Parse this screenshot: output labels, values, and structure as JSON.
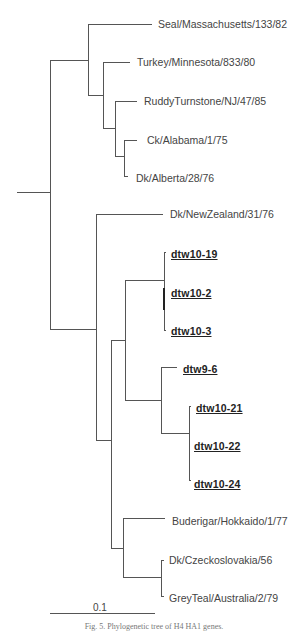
{
  "figure": {
    "caption": "Fig. 5. Phylogenetic tree of H4 HA1 genes.",
    "scale_bar": {
      "label": "0.1",
      "x1": 50,
      "x2": 155,
      "y": 613
    }
  },
  "tree": {
    "line_color": "#555555",
    "highlight_color": "#222222",
    "leaves": [
      {
        "name": "Seal/Massachusetts/133/82",
        "x": 158,
        "y": 24,
        "highlight": false
      },
      {
        "name": "Turkey/Minnesota/833/80",
        "x": 137,
        "y": 62,
        "highlight": false
      },
      {
        "name": "RuddyTurnstone/NJ/47/85",
        "x": 144,
        "y": 101,
        "highlight": false
      },
      {
        "name": "Ck/Alabama/1/75",
        "x": 147,
        "y": 140,
        "highlight": false
      },
      {
        "name": "Dk/Alberta/28/76",
        "x": 136,
        "y": 178,
        "highlight": false
      },
      {
        "name": "Dk/NewZealand/31/76",
        "x": 170,
        "y": 214,
        "highlight": false
      },
      {
        "name": "dtw10-19",
        "x": 171,
        "y": 254,
        "highlight": true
      },
      {
        "name": "dtw10-2",
        "x": 171,
        "y": 293,
        "highlight": true
      },
      {
        "name": "dtw10-3",
        "x": 171,
        "y": 331,
        "highlight": true
      },
      {
        "name": "dtw9-6",
        "x": 183,
        "y": 369,
        "highlight": true
      },
      {
        "name": "dtw10-21",
        "x": 196,
        "y": 408,
        "highlight": true
      },
      {
        "name": "dtw10-22",
        "x": 194,
        "y": 446,
        "highlight": true
      },
      {
        "name": "dtw10-24",
        "x": 194,
        "y": 484,
        "highlight": true
      },
      {
        "name": "Buderigar/Hokkaido/1/77",
        "x": 172,
        "y": 521,
        "highlight": false
      },
      {
        "name": "Dk/Czeckoslovakia/56",
        "x": 169,
        "y": 560,
        "highlight": false
      },
      {
        "name": "GreyTeal/Australia/2/79",
        "x": 169,
        "y": 598,
        "highlight": false
      }
    ],
    "segments": [
      [
        17,
        192,
        50,
        192
      ],
      [
        50,
        60,
        50,
        329
      ],
      [
        50,
        60,
        88,
        60
      ],
      [
        88,
        24,
        88,
        95
      ],
      [
        88,
        24,
        152,
        24
      ],
      [
        88,
        95,
        103,
        95
      ],
      [
        103,
        62,
        103,
        128
      ],
      [
        103,
        62,
        130,
        62
      ],
      [
        103,
        128,
        115,
        128
      ],
      [
        115,
        101,
        115,
        156
      ],
      [
        115,
        101,
        137,
        101
      ],
      [
        115,
        156,
        124,
        156
      ],
      [
        124,
        140,
        124,
        176
      ],
      [
        124,
        140,
        137,
        140
      ],
      [
        124,
        176,
        128,
        176
      ],
      [
        50,
        329,
        96,
        329
      ],
      [
        96,
        214,
        96,
        440
      ],
      [
        96,
        214,
        163,
        214
      ],
      [
        96,
        440,
        111,
        440
      ],
      [
        111,
        340,
        111,
        548
      ],
      [
        111,
        340,
        125,
        340
      ],
      [
        125,
        280,
        125,
        400
      ],
      [
        125,
        280,
        164,
        280
      ],
      [
        164,
        252,
        164,
        330
      ],
      [
        164,
        252,
        166,
        252
      ],
      [
        164,
        330,
        166,
        330
      ],
      [
        125,
        400,
        161,
        400
      ],
      [
        161,
        367,
        161,
        433
      ],
      [
        161,
        367,
        177,
        367
      ],
      [
        161,
        433,
        189,
        433
      ],
      [
        189,
        406,
        189,
        480
      ],
      [
        189,
        406,
        191,
        406
      ],
      [
        189,
        480,
        191,
        480
      ],
      [
        111,
        548,
        123,
        548
      ],
      [
        123,
        518,
        123,
        577
      ],
      [
        123,
        518,
        165,
        518
      ],
      [
        123,
        577,
        161,
        577
      ],
      [
        161,
        560,
        161,
        596
      ],
      [
        161,
        560,
        164,
        560
      ],
      [
        161,
        596,
        164,
        596
      ]
    ],
    "bold_segments": [
      [
        164,
        288,
        164,
        310
      ]
    ]
  }
}
